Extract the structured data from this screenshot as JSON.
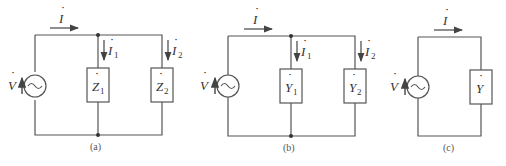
{
  "circuits": [
    {
      "caption": "(a)",
      "source_label": "V",
      "total_current": "I",
      "branches": [
        {
          "element": "Z",
          "sub": "1",
          "current": "I",
          "current_sub": "1"
        },
        {
          "element": "Z",
          "sub": "2",
          "current": "I",
          "current_sub": "2"
        }
      ]
    },
    {
      "caption": "(b)",
      "source_label": "V",
      "total_current": "I",
      "branches": [
        {
          "element": "Y",
          "sub": "1",
          "current": "I",
          "current_sub": "1"
        },
        {
          "element": "Y",
          "sub": "2",
          "current": "I",
          "current_sub": "2"
        }
      ]
    },
    {
      "caption": "(c)",
      "source_label": "V",
      "total_current": "I",
      "branches": [
        {
          "element": "Y",
          "sub": ""
        }
      ]
    }
  ],
  "dot_mark": "˙",
  "ac_symbol": "~"
}
